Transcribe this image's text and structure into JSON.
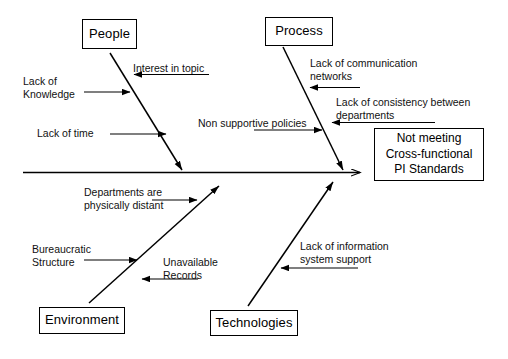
{
  "diagram": {
    "type": "fishbone-ishikawa",
    "effect": {
      "lines": [
        "Not meeting",
        "Cross-functional",
        "PI Standards"
      ]
    },
    "categories": [
      {
        "id": "people",
        "label": "People"
      },
      {
        "id": "process",
        "label": "Process"
      },
      {
        "id": "environment",
        "label": "Environment"
      },
      {
        "id": "technologies",
        "label": "Technologies"
      }
    ],
    "causes": {
      "people": [
        {
          "id": "lack-of-knowledge",
          "text": "Lack of\nKnowledge"
        },
        {
          "id": "interest-in-topic",
          "text": "Interest in topic"
        },
        {
          "id": "lack-of-time",
          "text": "Lack of time"
        }
      ],
      "process": [
        {
          "id": "lack-of-communication-networks",
          "text": "Lack of communication\nnetworks"
        },
        {
          "id": "lack-of-consistency-between-departments",
          "text": "Lack of consistency between\ndepartments"
        },
        {
          "id": "non-supportive-policies",
          "text": "Non supportive policies"
        }
      ],
      "environment": [
        {
          "id": "departments-are-physically-distant",
          "text": "Departments are\nphysically distant"
        },
        {
          "id": "bureaucratic-structure",
          "text": "Bureaucratic\nStructure"
        },
        {
          "id": "unavailable-records",
          "text": "Unavailable\nRecords"
        }
      ],
      "technologies": [
        {
          "id": "lack-of-information-system-support",
          "text": "Lack of information\nsystem support"
        }
      ]
    },
    "colors": {
      "line": "#000000",
      "text": "#000000",
      "background": "#ffffff"
    }
  }
}
